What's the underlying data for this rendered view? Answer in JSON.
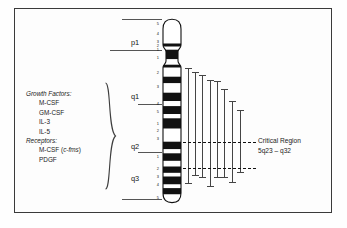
{
  "figure": {
    "background": "#fdfdfd",
    "frame_color": "#3a3a3a"
  },
  "gene_list": {
    "groups": [
      {
        "heading": "Growth Factors:",
        "items": [
          "M-CSF",
          "GM-CSF",
          "IL-3",
          "IL-5"
        ]
      },
      {
        "heading": "Receptors:",
        "items": [
          "M-CSF (c-fms)",
          "PDGF"
        ],
        "italic_fragments": [
          "c-fms"
        ]
      }
    ]
  },
  "chromosome": {
    "name": "5",
    "arms": [
      {
        "label": "p1",
        "x": 132,
        "y": 38
      },
      {
        "label": "q1",
        "x": 132,
        "y": 96
      },
      {
        "label": "q2",
        "x": 132,
        "y": 145
      },
      {
        "label": "q3",
        "x": 132,
        "y": 176
      }
    ],
    "band_numbers_p": [
      "5",
      "4",
      "3",
      "2",
      "1"
    ],
    "band_numbers_q1": [
      "1",
      "2",
      "3",
      "4",
      "5"
    ],
    "band_numbers_q2": [
      "1",
      "2",
      "3"
    ],
    "band_numbers_q3": [
      "1",
      "2",
      "3",
      "4",
      "5"
    ],
    "bands": [
      {
        "id": "p15",
        "y": 21.0,
        "h": 4.5,
        "fill": "white"
      },
      {
        "id": "p14",
        "y": 25.5,
        "h": 3.2,
        "fill": "black"
      },
      {
        "id": "p13",
        "y": 28.7,
        "h": 3.0,
        "fill": "white"
      },
      {
        "id": "p12",
        "y": 31.7,
        "h": 9.6,
        "fill": "black"
      },
      {
        "id": "p11",
        "y": 41.3,
        "h": 5.4,
        "fill": "white"
      },
      {
        "id": "cen",
        "y": 46.7,
        "h": 3.0,
        "fill": "black"
      },
      {
        "id": "q11",
        "y": 49.7,
        "h": 9.0,
        "fill": "white"
      },
      {
        "id": "q12",
        "y": 58.7,
        "h": 6.6,
        "fill": "black"
      },
      {
        "id": "q13",
        "y": 65.3,
        "h": 9.4,
        "fill": "white"
      },
      {
        "id": "q14",
        "y": 74.7,
        "h": 8.4,
        "fill": "black"
      },
      {
        "id": "q15",
        "y": 83.1,
        "h": 5.0,
        "fill": "white"
      },
      {
        "id": "q21",
        "y": 88.1,
        "h": 8.0,
        "fill": "black"
      },
      {
        "id": "q22",
        "y": 96.1,
        "h": 4.2,
        "fill": "white"
      },
      {
        "id": "q23",
        "y": 100.3,
        "h": 10.4,
        "fill": "black"
      },
      {
        "id": "q31",
        "y": 110.7,
        "h": 13.0,
        "fill": "white"
      },
      {
        "id": "q32",
        "y": 123.7,
        "h": 7.6,
        "fill": "black"
      },
      {
        "id": "q33",
        "y": 131.3,
        "h": 4.0,
        "fill": "white"
      },
      {
        "id": "q34",
        "y": 135.3,
        "h": 7.6,
        "fill": "black"
      },
      {
        "id": "q35",
        "y": 142.9,
        "h": 5.6,
        "fill": "white"
      }
    ]
  },
  "deletion_bars": {
    "count": 8,
    "color": "#444444",
    "intervals": [
      {
        "x": 188,
        "top": 68,
        "bottom": 183
      },
      {
        "x": 195,
        "top": 72,
        "bottom": 175
      },
      {
        "x": 202,
        "top": 75,
        "bottom": 177
      },
      {
        "x": 210,
        "top": 80,
        "bottom": 186
      },
      {
        "x": 217,
        "top": 81,
        "bottom": 177
      },
      {
        "x": 224,
        "top": 89,
        "bottom": 177
      },
      {
        "x": 232,
        "top": 101,
        "bottom": 182
      },
      {
        "x": 240,
        "top": 110,
        "bottom": 172
      }
    ]
  },
  "critical_region": {
    "line1": "Critical Region",
    "line2": "5q23 – q32",
    "guide_lines_y": [
      141.5,
      168.0
    ],
    "guide_x_start": 178,
    "guide_x_end": 256
  }
}
